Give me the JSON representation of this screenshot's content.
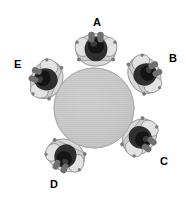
{
  "figure": {
    "background_color": "#ffffff",
    "width": 186,
    "height": 201
  },
  "table": {
    "name": "round-table",
    "shape": "circle",
    "center_x": 94,
    "center_y": 108,
    "radius": 40,
    "fill_color": "#c9c9c9",
    "edge_color": "#b0b0b0",
    "texture": "fine horizontal hatching"
  },
  "seats": [
    {
      "id": "A",
      "label": "A",
      "position": "top",
      "angle_deg": 270,
      "label_x": 93,
      "label_y": 17,
      "person": {
        "center_x": 96,
        "center_y": 48,
        "rotation_deg": 0,
        "head_color": "#3a3a3a",
        "body_color": "#909090",
        "shoulder_color": "#d0d0d0"
      }
    },
    {
      "id": "B",
      "label": "B",
      "position": "upper-right",
      "angle_deg": 330,
      "label_x": 169,
      "label_y": 53,
      "person": {
        "center_x": 146,
        "center_y": 74,
        "rotation_deg": 62,
        "head_color": "#2b2b2b",
        "body_color": "#8a8a8a",
        "shoulder_color": "#cfcfcf"
      }
    },
    {
      "id": "C",
      "label": "C",
      "position": "lower-right",
      "angle_deg": 40,
      "label_x": 160,
      "label_y": 156,
      "person": {
        "center_x": 141,
        "center_y": 138,
        "rotation_deg": 128,
        "head_color": "#151515",
        "body_color": "#8d8d8d",
        "shoulder_color": "#cccccc"
      }
    },
    {
      "id": "D",
      "label": "D",
      "position": "bottom-left",
      "angle_deg": 112,
      "label_x": 50,
      "label_y": 179,
      "person": {
        "center_x": 65,
        "center_y": 157,
        "rotation_deg": 205,
        "head_color": "#1c1c1c",
        "body_color": "#8d8d8d",
        "shoulder_color": "#d2d2d2"
      }
    },
    {
      "id": "E",
      "label": "E",
      "position": "upper-left",
      "angle_deg": 200,
      "label_x": 14,
      "label_y": 59,
      "person": {
        "center_x": 45,
        "center_y": 79,
        "rotation_deg": 292,
        "head_color": "#202020",
        "body_color": "#8f8f8f",
        "shoulder_color": "#d4d4d4"
      }
    }
  ]
}
